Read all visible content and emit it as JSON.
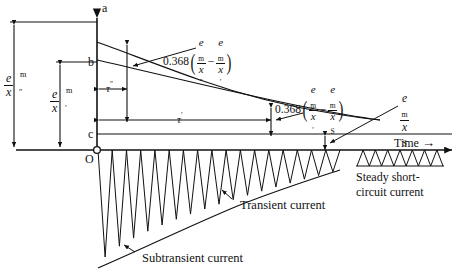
{
  "figure": {
    "axes": {
      "time_axis_label": "Time",
      "time_arrow": "→",
      "origin_label": "O",
      "point_a": "a",
      "point_b": "b",
      "point_c": "c"
    },
    "amplitude_labels": [
      {
        "name": "subtransient-amplitude",
        "numerator": "e",
        "num_sup": "m",
        "denominator": "x",
        "den_prime": "″"
      },
      {
        "name": "transient-amplitude",
        "numerator": "e",
        "num_sup": "m",
        "denominator": "x",
        "den_prime": "′"
      },
      {
        "name": "steady-amplitude",
        "numerator": "e",
        "num_sup": "m",
        "denominator": "x",
        "den_sub": "S"
      }
    ],
    "time_constants": [
      {
        "name": "subtransient-time-constant",
        "symbol": "τ",
        "prime": "″"
      },
      {
        "name": "transient-time-constant",
        "symbol": "τ",
        "prime": "′"
      }
    ],
    "annotations": [
      {
        "name": "subtransient-decay-annotation",
        "coefficient": "0.368",
        "term1": {
          "num": "e",
          "num_sub": "m",
          "den": "x",
          "den_prime": "″"
        },
        "operator": "−",
        "term2": {
          "num": "e",
          "num_sub": "m",
          "den": "x",
          "den_prime": "′"
        }
      },
      {
        "name": "transient-decay-annotation",
        "coefficient": "0.368",
        "term1": {
          "num": "e",
          "num_sub": "m",
          "den": "x",
          "den_prime": "′"
        },
        "operator": "−",
        "term2": {
          "num": "e",
          "num_sub": "m",
          "den": "x",
          "den_sub": "S"
        }
      }
    ],
    "curve_labels": [
      {
        "name": "transient-current-label",
        "text": "Transient current"
      },
      {
        "name": "subtransient-current-label",
        "text": "Subtransient current"
      },
      {
        "name": "steady-short-circuit-label",
        "line1": "Steady short-",
        "line2": "circuit current"
      }
    ]
  },
  "chart_data": {
    "type": "line",
    "xlabel": "Time",
    "ylabel": "Current amplitude",
    "grid": false,
    "legend": "none",
    "axis_levels": {
      "a_level": 1.0,
      "b_level": 0.72,
      "c_level": 0.14,
      "zero_level": 0.0
    },
    "series": [
      {
        "name": "subtransient envelope (upper curve)",
        "description": "double-exponential decay from a to steady level",
        "x": [
          0,
          0.05,
          0.12,
          0.22,
          0.35,
          0.5,
          0.65,
          0.8,
          0.92,
          1.0
        ],
        "y": [
          0.9,
          0.845,
          0.785,
          0.715,
          0.625,
          0.53,
          0.44,
          0.355,
          0.295,
          0.255
        ]
      },
      {
        "name": "transient envelope (lower straight-ish line)",
        "description": "single-exponential transient decay from b",
        "x": [
          0,
          0.2,
          0.45,
          0.7,
          1.0
        ],
        "y": [
          0.72,
          0.645,
          0.555,
          0.465,
          0.355
        ]
      },
      {
        "name": "oscillating short-circuit current",
        "description": "decaying sinusoidal waveform below the time axis",
        "cycles": 17,
        "initial_peak": -1.0,
        "final_peak": -0.17
      },
      {
        "name": "steady short-circuit current",
        "description": "constant amplitude sinusoid inset at right",
        "cycles": 7,
        "peak": -0.09
      }
    ],
    "markers": [
      {
        "label": "0.368(e_m/x'' - e_m/x')",
        "x": 0.12,
        "note": "one subtransient time constant"
      },
      {
        "label": "0.368(e_m/x' - e_m/x_S)",
        "x": 0.78,
        "note": "one transient time constant"
      }
    ],
    "time_constants": {
      "tau_double_prime": 0.12,
      "tau_prime": 0.78
    }
  }
}
